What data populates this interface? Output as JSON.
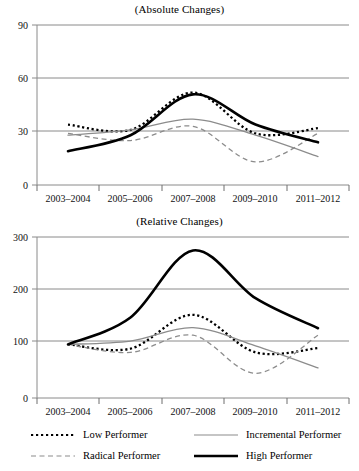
{
  "figure": {
    "background": "#ffffff",
    "axis_color": "#808080",
    "text_color": "#111111"
  },
  "charts": [
    {
      "id": "absolute",
      "title": "(Absolute Changes)",
      "yticks": [
        "0",
        "30",
        "60",
        "90"
      ]
    },
    {
      "id": "relative",
      "title": "(Relative Changes)",
      "yticks": [
        "0",
        "100",
        "200",
        "300"
      ]
    }
  ],
  "xticks": [
    "2003–2004",
    "2005–2006",
    "2007–2008",
    "2009–2010",
    "2011–2012"
  ],
  "legend": {
    "items": [
      {
        "label": "Low Performer",
        "style": "dotted",
        "color": "#000000",
        "key": "low-performer-key"
      },
      {
        "label": "Incremental Performer",
        "style": "solid-thin",
        "color": "#8c8c8c",
        "key": "incremental-performer-key"
      },
      {
        "label": "Radical Performer",
        "style": "dashed",
        "color": "#8c8c8c",
        "key": "radical-performer-key"
      },
      {
        "label": "High Performer",
        "style": "solid-thick",
        "color": "#000000",
        "key": "high-performer-key"
      }
    ]
  },
  "chart_data": [
    {
      "type": "line",
      "title": "(Absolute Changes)",
      "xlabel": "",
      "ylabel": "",
      "categories": [
        "2003–2004",
        "2005–2006",
        "2007–2008",
        "2009–2010",
        "2011–2012"
      ],
      "ylim": [
        0,
        90
      ],
      "yticks": [
        0,
        30,
        60,
        90
      ],
      "grid": true,
      "legend_position": "bottom",
      "series": [
        {
          "name": "Low Performer",
          "style": "dotted",
          "color": "#000000",
          "values": [
            34,
            31,
            52,
            29,
            32
          ]
        },
        {
          "name": "Incremental Performer",
          "style": "solid-thin",
          "color": "#8c8c8c",
          "values": [
            28,
            31,
            37,
            28,
            16
          ]
        },
        {
          "name": "Radical Performer",
          "style": "dashed",
          "color": "#8c8c8c",
          "values": [
            29,
            25,
            33,
            13,
            29
          ]
        },
        {
          "name": "High Performer",
          "style": "solid-thick",
          "color": "#000000",
          "values": [
            19,
            28,
            51,
            34,
            24
          ]
        }
      ]
    },
    {
      "type": "line",
      "title": "(Relative Changes)",
      "xlabel": "",
      "ylabel": "",
      "categories": [
        "2003–2004",
        "2005–2006",
        "2007–2008",
        "2009–2010",
        "2011–2012"
      ],
      "ylim": [
        0,
        300
      ],
      "yticks": [
        0,
        100,
        200,
        300
      ],
      "grid": true,
      "legend_position": "bottom",
      "series": [
        {
          "name": "Low Performer",
          "style": "dotted",
          "color": "#000000",
          "values": [
            100,
            92,
            155,
            85,
            93
          ]
        },
        {
          "name": "Incremental Performer",
          "style": "solid-thin",
          "color": "#8c8c8c",
          "values": [
            100,
            106,
            131,
            97,
            56
          ]
        },
        {
          "name": "Radical Performer",
          "style": "dashed",
          "color": "#8c8c8c",
          "values": [
            100,
            85,
            117,
            46,
            117
          ]
        },
        {
          "name": "High Performer",
          "style": "solid-thick",
          "color": "#000000",
          "values": [
            100,
            150,
            275,
            186,
            130
          ]
        }
      ]
    }
  ]
}
